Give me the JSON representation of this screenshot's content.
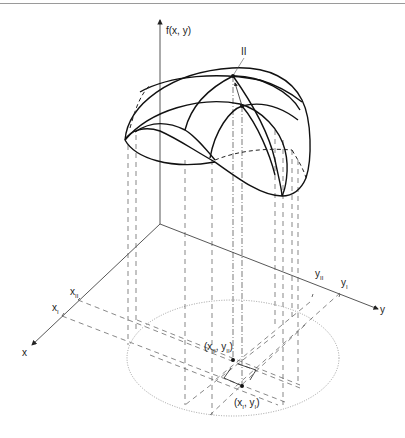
{
  "diagram": {
    "axes": {
      "z_label": "f(x, y)",
      "x_label": "x",
      "y_label": "y"
    },
    "surface_point_label": "II",
    "x_ticks": [
      {
        "base": "x",
        "sub": "II"
      },
      {
        "base": "x",
        "sub": "I"
      }
    ],
    "y_ticks": [
      {
        "base": "y",
        "sub": "II"
      },
      {
        "base": "y",
        "sub": "I"
      }
    ],
    "points": [
      {
        "label": "(x_II, y_II)",
        "base_x": "x",
        "sub_x": "II",
        "base_y": "y",
        "sub_y": "II"
      },
      {
        "label": "(x_I, y_I)",
        "base_x": "x",
        "sub_x": "I",
        "base_y": "y",
        "sub_y": "I"
      }
    ],
    "colors": {
      "line": "#222222",
      "axis": "#444444",
      "dashed": "#555555",
      "dotted": "#777777"
    }
  }
}
